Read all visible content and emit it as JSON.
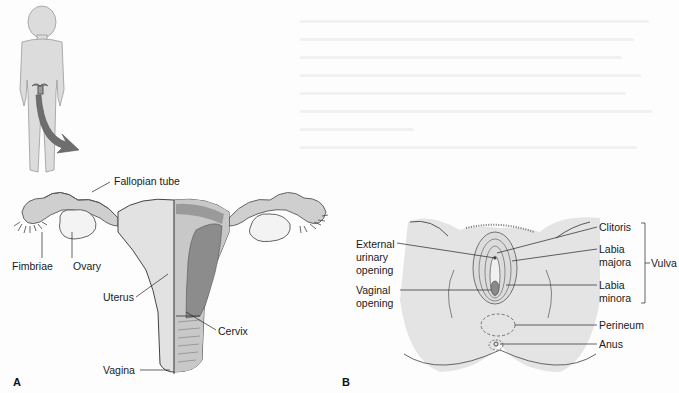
{
  "figure": {
    "panel_a": {
      "letter": "A",
      "labels": {
        "fallopian_tube": "Fallopian tube",
        "fimbriae": "Fimbriae",
        "ovary": "Ovary",
        "uterus": "Uterus",
        "cervix": "Cervix",
        "vagina": "Vagina"
      }
    },
    "panel_b": {
      "letter": "B",
      "labels": {
        "external_urinary_opening": [
          "External",
          "urinary",
          "opening"
        ],
        "vaginal_opening": [
          "Vaginal",
          "opening"
        ],
        "clitoris": "Clitoris",
        "labia_majora": [
          "Labia",
          "majora"
        ],
        "labia_minora": [
          "Labia",
          "minora"
        ],
        "vulva": "Vulva",
        "perineum": "Perineum",
        "anus": "Anus"
      }
    },
    "colors": {
      "body_fill": "#d9d9d9",
      "organ_fill": "#cfcfcf",
      "dark_tissue": "#8c8c8c",
      "arrow": "#6e6e6e",
      "line": "#333333"
    }
  }
}
